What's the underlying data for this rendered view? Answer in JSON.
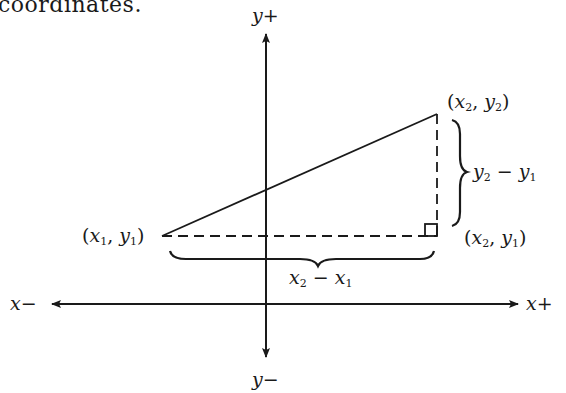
{
  "caption_fragment": "coordinates.",
  "axes": {
    "y_plus": "y+",
    "y_minus": "y−",
    "x_plus": "x+",
    "x_minus": "x−"
  },
  "points": {
    "p1": {
      "label_open": "(",
      "v1": "x",
      "s1": "1",
      "comma": ", ",
      "v2": "y",
      "s2": "1",
      "label_close": ")"
    },
    "p2": {
      "label_open": "(",
      "v1": "x",
      "s1": "2",
      "comma": ", ",
      "v2": "y",
      "s2": "2",
      "label_close": ")"
    },
    "p3": {
      "label_open": "(",
      "v1": "x",
      "s1": "2",
      "comma": ", ",
      "v2": "y",
      "s2": "1",
      "label_close": ")"
    }
  },
  "differences": {
    "dy": {
      "a": "y",
      "as": "2",
      "op": " − ",
      "b": "y",
      "bs": "1"
    },
    "dx": {
      "a": "x",
      "as": "2",
      "op": " − ",
      "b": "x",
      "bs": "1"
    }
  },
  "colors": {
    "ink": "#1a1a1a",
    "background": "#ffffff"
  }
}
